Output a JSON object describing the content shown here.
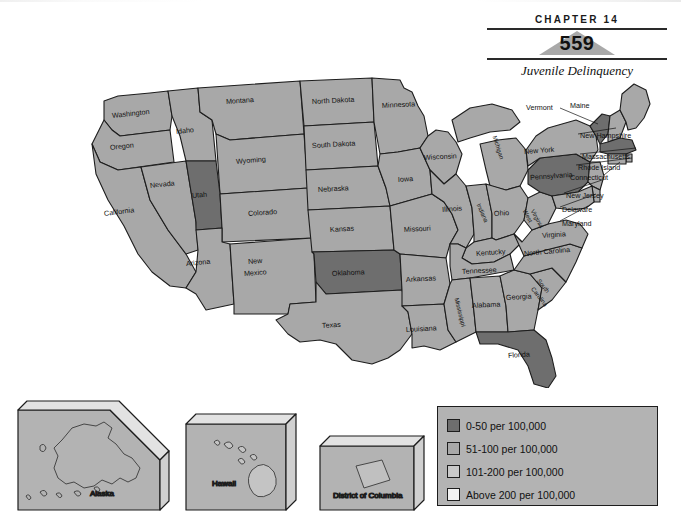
{
  "header": {
    "chapter_label": "CHAPTER 14",
    "page_number": "559",
    "chapter_title": "Juvenile Delinquency"
  },
  "colors": {
    "rate_0_50": "#6e6e6e",
    "rate_51_100": "#a8a8a8",
    "rate_101_200": "#c9c9c9",
    "rate_above_200": "#f2f2f2",
    "water": "#ffffff",
    "outline": "#1d1d1d",
    "legend_background": "#b3b3b3",
    "page_number_shape": "#a9a9a9"
  },
  "legend": {
    "items": [
      {
        "label": "0-50 per 100,000",
        "swatch": "#6e6e6e"
      },
      {
        "label": "51-100 per 100,000",
        "swatch": "#a8a8a8"
      },
      {
        "label": "101-200 per 100,000",
        "swatch": "#c9c9c9"
      },
      {
        "label": "Above 200 per 100,000",
        "swatch": "#f2f2f2"
      }
    ]
  },
  "map": {
    "type": "choropleth",
    "title": "",
    "states": [
      {
        "name": "Washington",
        "category": "51-100 per 100,000"
      },
      {
        "name": "Oregon",
        "category": "51-100 per 100,000"
      },
      {
        "name": "Idaho",
        "category": "51-100 per 100,000"
      },
      {
        "name": "Montana",
        "category": "51-100 per 100,000"
      },
      {
        "name": "Wyoming",
        "category": "51-100 per 100,000"
      },
      {
        "name": "Nevada",
        "category": "51-100 per 100,000"
      },
      {
        "name": "Utah",
        "category": "0-50 per 100,000"
      },
      {
        "name": "California",
        "category": "51-100 per 100,000"
      },
      {
        "name": "Arizona",
        "category": "51-100 per 100,000"
      },
      {
        "name": "New Mexico",
        "category": "51-100 per 100,000"
      },
      {
        "name": "Colorado",
        "category": "51-100 per 100,000"
      },
      {
        "name": "North Dakota",
        "category": "51-100 per 100,000"
      },
      {
        "name": "South Dakota",
        "category": "51-100 per 100,000"
      },
      {
        "name": "Nebraska",
        "category": "51-100 per 100,000"
      },
      {
        "name": "Kansas",
        "category": "51-100 per 100,000"
      },
      {
        "name": "Oklahoma",
        "category": "0-50 per 100,000"
      },
      {
        "name": "Texas",
        "category": "51-100 per 100,000"
      },
      {
        "name": "Minnesota",
        "category": "51-100 per 100,000"
      },
      {
        "name": "Iowa",
        "category": "51-100 per 100,000"
      },
      {
        "name": "Missouri",
        "category": "51-100 per 100,000"
      },
      {
        "name": "Arkansas",
        "category": "51-100 per 100,000"
      },
      {
        "name": "Louisiana",
        "category": "51-100 per 100,000"
      },
      {
        "name": "Wisconsin",
        "category": "51-100 per 100,000"
      },
      {
        "name": "Illinois",
        "category": "51-100 per 100,000"
      },
      {
        "name": "Michigan",
        "category": "51-100 per 100,000"
      },
      {
        "name": "Indiana",
        "category": "51-100 per 100,000"
      },
      {
        "name": "Ohio",
        "category": "51-100 per 100,000"
      },
      {
        "name": "Kentucky",
        "category": "51-100 per 100,000"
      },
      {
        "name": "Tennessee",
        "category": "51-100 per 100,000"
      },
      {
        "name": "Mississippi",
        "category": "51-100 per 100,000"
      },
      {
        "name": "Alabama",
        "category": "51-100 per 100,000"
      },
      {
        "name": "Georgia",
        "category": "51-100 per 100,000"
      },
      {
        "name": "Florida",
        "category": "0-50 per 100,000"
      },
      {
        "name": "South Carolina",
        "category": "51-100 per 100,000"
      },
      {
        "name": "North Carolina",
        "category": "51-100 per 100,000"
      },
      {
        "name": "Virginia",
        "category": "51-100 per 100,000"
      },
      {
        "name": "West Virginia",
        "category": "51-100 per 100,000"
      },
      {
        "name": "Pennsylvania",
        "category": "0-50 per 100,000"
      },
      {
        "name": "New York",
        "category": "51-100 per 100,000"
      },
      {
        "name": "Vermont",
        "category": "0-50 per 100,000"
      },
      {
        "name": "Maine",
        "category": "51-100 per 100,000"
      },
      {
        "name": "New Hampshire",
        "category": "51-100 per 100,000"
      },
      {
        "name": "Massachusetts",
        "category": "0-50 per 100,000"
      },
      {
        "name": "Rhode Island",
        "category": "51-100 per 100,000"
      },
      {
        "name": "Connecticut",
        "category": "51-100 per 100,000"
      },
      {
        "name": "New Jersey",
        "category": "51-100 per 100,000"
      },
      {
        "name": "Delaware",
        "category": "51-100 per 100,000"
      },
      {
        "name": "Maryland",
        "category": "51-100 per 100,000"
      }
    ],
    "labels": {
      "washington": "Washington",
      "oregon": "Oregon",
      "idaho": "Idaho",
      "montana": "Montana",
      "wyoming": "Wyoming",
      "nevada": "Nevada",
      "utah": "Utah",
      "california": "California",
      "arizona": "Arizona",
      "new_mexico_1": "New",
      "new_mexico_2": "Mexico",
      "colorado": "Colorado",
      "north_dakota": "North Dakota",
      "south_dakota": "South Dakota",
      "nebraska": "Nebraska",
      "kansas": "Kansas",
      "oklahoma": "Oklahoma",
      "texas": "Texas",
      "minnesota": "Minnesota",
      "iowa": "Iowa",
      "missouri": "Missouri",
      "arkansas": "Arkansas",
      "louisiana": "Louisiana",
      "wisconsin": "Wisconsin",
      "illinois": "Illinois",
      "michigan": "Michigan",
      "indiana": "Indiana",
      "ohio": "Ohio",
      "kentucky": "Kentucky",
      "tennessee": "Tennessee",
      "mississippi": "Mississippi",
      "alabama": "Alabama",
      "georgia": "Georgia",
      "florida": "Florida",
      "south_carolina_1": "South",
      "south_carolina_2": "Carolina",
      "north_carolina": "North Carolina",
      "virginia": "Virginia",
      "west_virginia_1": "West",
      "west_virginia_2": "Virginia",
      "pennsylvania": "Pennsylvania",
      "new_york": "New York",
      "vermont": "Vermont",
      "maine": "Maine",
      "new_hampshire": "New Hampshire",
      "massachusetts": "Massachusetts",
      "rhode_island": "Rhode Island",
      "connecticut": "Connecticut",
      "new_jersey": "New Jersey",
      "delaware": "Delaware",
      "maryland": "Maryland"
    }
  },
  "insets": [
    {
      "name": "Alaska",
      "label": "Alaska",
      "category": "51-100 per 100,000"
    },
    {
      "name": "Hawaii",
      "label": "Hawaii",
      "category": "51-100 per 100,000"
    },
    {
      "name": "District of Columbia",
      "label": "District of Columbia",
      "category": "51-100 per 100,000"
    }
  ]
}
